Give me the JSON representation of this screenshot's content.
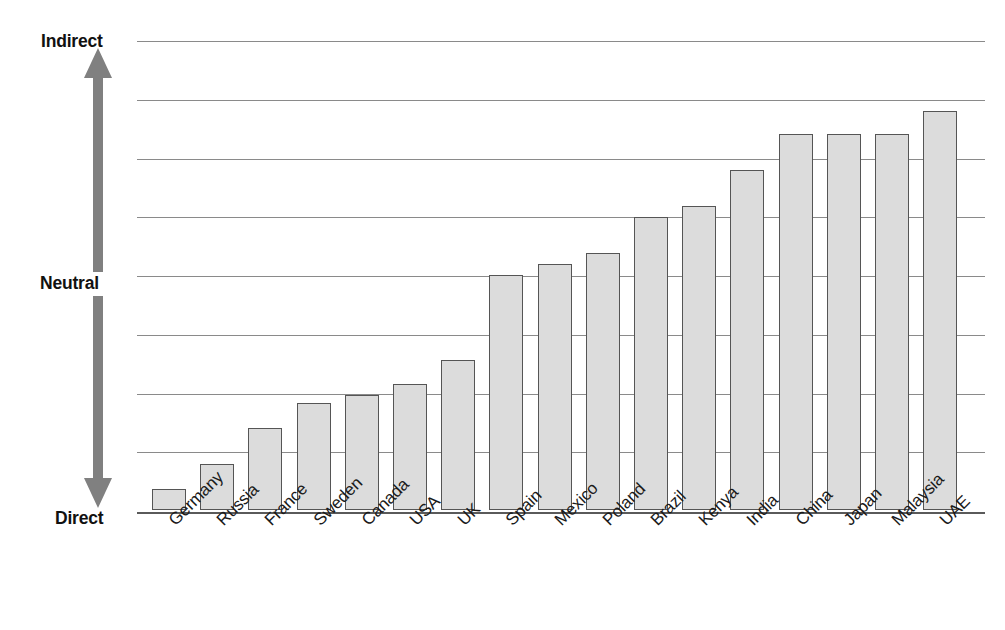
{
  "chart_data": {
    "type": "bar",
    "title": "",
    "subtitle": "",
    "xlabel": "",
    "ylabel": "",
    "grid": true,
    "legend": false,
    "legend_position": "none",
    "orientation": "vertical",
    "ylim": [
      0,
      8
    ],
    "y_axis_kind": "ordinal-scale",
    "y_axis_low_label": "Direct",
    "y_axis_mid_label": "Neutral",
    "y_axis_high_label": "Indirect",
    "y_gridline_values": [
      1,
      2,
      3,
      4,
      5,
      6,
      7,
      8
    ],
    "y_named_ticks": [
      {
        "label": "Direct",
        "value": 0
      },
      {
        "label": "Neutral",
        "value": 4
      },
      {
        "label": "Indirect",
        "value": 8
      }
    ],
    "categories": [
      "Germany",
      "Russia",
      "France",
      "Sweden",
      "Canada",
      "USA",
      "UK",
      "Spain",
      "Mexico",
      "Poland",
      "Brazil",
      "Kenya",
      "India",
      "China",
      "Japan",
      "Malaysia",
      "UAE"
    ],
    "values": [
      0.35,
      0.79,
      1.39,
      1.82,
      1.96,
      2.15,
      2.56,
      4.0,
      4.18,
      4.37,
      4.99,
      5.18,
      5.79,
      6.4,
      6.4,
      6.4,
      6.8
    ],
    "series": [
      {
        "name": "Communication style",
        "values": [
          0.35,
          0.79,
          1.39,
          1.82,
          1.96,
          2.15,
          2.56,
          4.0,
          4.18,
          4.37,
          4.99,
          5.18,
          5.79,
          6.4,
          6.4,
          6.4,
          6.8
        ]
      }
    ],
    "colors": {
      "bar_fill": "#dcdcdc",
      "bar_stroke": "#555555",
      "gridline": "#8a8a8a",
      "baseline": "#5a5a5a",
      "arrow": "#808080",
      "text": "#1a1a1a",
      "background": "#ffffff"
    }
  },
  "axis": {
    "arrow_name": "direct-indirect-arrow",
    "top_label": "Indirect",
    "middle_label": "Neutral",
    "bottom_label": "Direct"
  }
}
